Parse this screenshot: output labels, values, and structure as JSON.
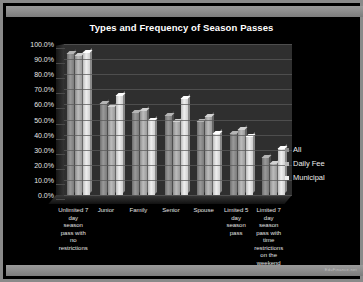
{
  "slide": {
    "watermark": "EduFinance.net"
  },
  "chart_data": {
    "type": "bar",
    "title": "Types and Frequency of Season Passes",
    "xlabel": "",
    "ylabel": "",
    "ylim": [
      0,
      100
    ],
    "grid": true,
    "legend_position": "right",
    "y_ticks": [
      "0.0%",
      "10.0%",
      "20.0%",
      "30.0%",
      "40.0%",
      "50.0%",
      "60.0%",
      "70.0%",
      "80.0%",
      "90.0%",
      "100.0%"
    ],
    "categories": [
      "Unlimited 7 day season pass with no restrictions",
      "Junior",
      "Family",
      "Senior",
      "Spouse",
      "Limited 5 day season pass",
      "Limited 7 day season pass with time restrictions on the weekend"
    ],
    "series": [
      {
        "name": "All",
        "color": "#8f8f8f",
        "values": [
          94,
          61,
          55,
          53,
          49,
          41,
          25
        ]
      },
      {
        "name": "Daily Fee",
        "color": "#b8b8b8",
        "values": [
          93,
          59,
          56,
          49,
          52,
          44,
          21
        ]
      },
      {
        "name": "Municipal",
        "color": "#eeeeee",
        "values": [
          95,
          66,
          50,
          64,
          41,
          39,
          31
        ]
      }
    ]
  }
}
